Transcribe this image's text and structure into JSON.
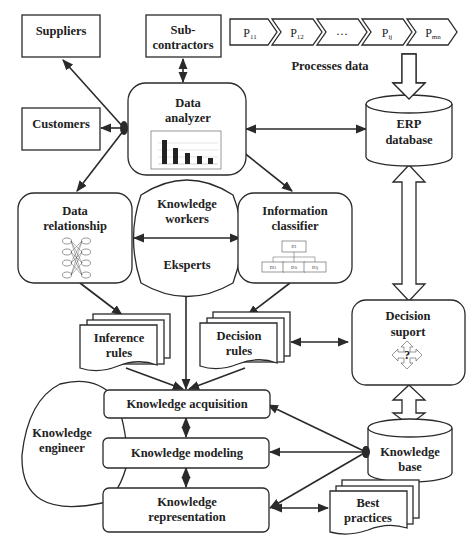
{
  "nodes": {
    "suppliers": "Suppliers",
    "subcontractors": [
      "Sub-",
      "contractors"
    ],
    "customers": "Customers",
    "data_analyzer": [
      "Data",
      "analyzer"
    ],
    "data_relationship": [
      "Data",
      "relationship"
    ],
    "knowledge_workers": [
      "Knowledge",
      "workers"
    ],
    "eksperts": "Eksperts",
    "information_classifier": [
      "Information",
      "classifier"
    ],
    "erp_database": [
      "ERP",
      "database"
    ],
    "inference_rules": [
      "Inference",
      "rules"
    ],
    "decision_rules": [
      "Decision",
      "rules"
    ],
    "decision_support": [
      "Decision",
      "suport"
    ],
    "decision_support_symbol": "?",
    "knowledge_engineer": [
      "Knowledge",
      "engineer"
    ],
    "knowledge_acquisition": "Knowledge acquisition",
    "knowledge_modeling": "Knowledge modeling",
    "knowledge_representation": [
      "Knowledge",
      "representation"
    ],
    "knowledge_base": [
      "Knowledge",
      "base"
    ],
    "best_practices": [
      "Best",
      "practices"
    ]
  },
  "processes": {
    "label": "Processes data",
    "steps": [
      {
        "base": "P",
        "sub": "11"
      },
      {
        "base": "P",
        "sub": "12"
      },
      {
        "base": "…",
        "sub": ""
      },
      {
        "base": "P",
        "sub": "ij"
      },
      {
        "base": "P",
        "sub": "mn"
      }
    ]
  },
  "classifier_icon": {
    "root": "D1",
    "children": [
      "D11",
      "D1i",
      "D1j"
    ]
  },
  "relationship_icon": {
    "left": [
      "f1",
      "f2",
      "...",
      "fk"
    ],
    "right": [
      "f1",
      "f2",
      "...",
      "fk"
    ]
  },
  "analyzer_chart": {
    "bars": [
      90,
      58,
      40,
      30,
      22
    ]
  }
}
